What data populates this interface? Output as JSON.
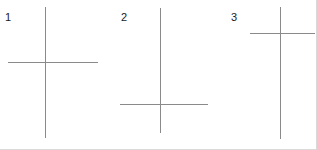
{
  "figure": {
    "width": 317,
    "height": 150,
    "background_color": "#ffffff",
    "stroke_color": "#8a8a8a",
    "label_color": "#1a1a1a",
    "border_color": "#d9d9d9",
    "crosses": [
      {
        "label": "1",
        "description": "cross with horizontal bar near the middle of the vertical bar",
        "vertical": {
          "x": 45,
          "y_top": 7,
          "y_bottom": 138
        },
        "horizontal": {
          "y": 62,
          "x_left": 8,
          "x_right": 98
        }
      },
      {
        "label": "2",
        "description": "cross with horizontal bar low on the vertical bar",
        "vertical": {
          "x": 160,
          "y_top": 8,
          "y_bottom": 133
        },
        "horizontal": {
          "y": 104,
          "x_left": 120,
          "x_right": 208
        }
      },
      {
        "label": "3",
        "description": "cross with horizontal bar high on the vertical bar, crucifix shape",
        "vertical": {
          "x": 280,
          "y_top": 7,
          "y_bottom": 139
        },
        "horizontal": {
          "y": 33,
          "x_left": 250,
          "x_right": 315
        }
      }
    ]
  }
}
